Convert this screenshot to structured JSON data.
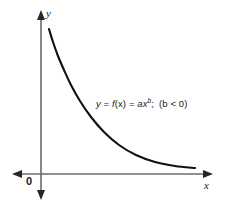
{
  "figure": {
    "background_color": "#ffffff",
    "width": 225,
    "height": 216
  },
  "axes": {
    "x_label": "x",
    "y_label": "y",
    "origin_label": "0",
    "axis_color": "#6a6a6a",
    "arrowhead_color": "#262626",
    "x_axis": {
      "y_pixel": 174,
      "start_pixel": 12,
      "end_pixel": 213,
      "arrow_both_ends": true
    },
    "y_axis": {
      "x_pixel": 41,
      "start_pixel": 10,
      "end_pixel": 200,
      "arrow_both_ends": true
    }
  },
  "annotation": {
    "equation_plain": "y = f(x) = ax^b ; (b < 0)",
    "parts": {
      "y": "y",
      "eq1": " = ",
      "f": "f",
      "of_x": "(x)",
      "eq2": " = ",
      "a": "a",
      "x": "x",
      "b_exponent": "b",
      "semicolon": ";",
      "condition": "(b < 0)"
    },
    "text_color": "#1a1a1a"
  },
  "chart_data": {
    "type": "line",
    "title": "",
    "xlabel": "x",
    "ylabel": "y",
    "function": "y = f(x) = ax^b  (b < 0)",
    "curve_color": "#111111",
    "curve_width": 2.1,
    "points_pixel": [
      [
        49,
        29
      ],
      [
        53,
        42
      ],
      [
        58,
        56
      ],
      [
        64,
        70
      ],
      [
        71,
        85
      ],
      [
        80,
        101
      ],
      [
        91,
        117
      ],
      [
        104,
        132
      ],
      [
        119,
        145
      ],
      [
        136,
        155
      ],
      [
        155,
        162
      ],
      [
        175,
        166
      ],
      [
        195,
        168
      ]
    ],
    "asymptotes": [
      "x = 0",
      "y = 0"
    ],
    "grid": false,
    "legend": false
  }
}
